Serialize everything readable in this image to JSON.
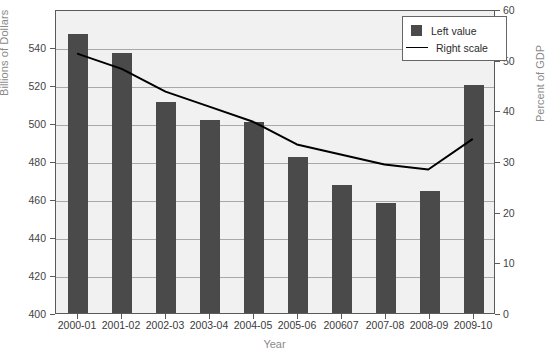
{
  "chart_data": {
    "type": "bar",
    "title": "",
    "xlabel": "Year",
    "ylabel": "Billions of Dollars",
    "y2label": "Percent of GDP",
    "categories": [
      "2000-01",
      "2001-02",
      "2002-03",
      "2003-04",
      "2004-05",
      "2005-06",
      "200607",
      "2007-08",
      "2008-09",
      "2009-10"
    ],
    "ylim": [
      400,
      560
    ],
    "yticks": [
      400,
      420,
      440,
      460,
      480,
      500,
      520,
      540
    ],
    "y2lim": [
      0,
      60
    ],
    "y2ticks": [
      0,
      10,
      20,
      30,
      40,
      50,
      60
    ],
    "grid": true,
    "legend_position": "top-right",
    "series": [
      {
        "name": "Left value",
        "type": "bar",
        "axis": "left",
        "color": "#4a4a4a",
        "values": [
          547,
          537,
          511,
          501.5,
          500.5,
          482,
          467.5,
          458,
          464,
          520
        ]
      },
      {
        "name": "Right scale",
        "type": "line",
        "axis": "right",
        "color": "#000000",
        "values": [
          51.5,
          48.5,
          44,
          41,
          38,
          33.5,
          31.5,
          29.5,
          28.5,
          34.5
        ]
      }
    ]
  },
  "legend": {
    "items": [
      {
        "label": "Left value",
        "marker": "square-swatch"
      },
      {
        "label": "Right scale",
        "marker": "line-swatch"
      }
    ]
  },
  "axes": {
    "left_title": "Billions of Dollars",
    "right_title": "Percent of GDP",
    "bottom_title": "Year"
  }
}
